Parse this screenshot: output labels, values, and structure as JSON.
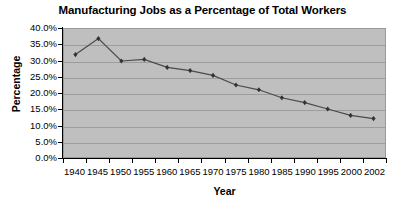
{
  "chart_data": {
    "type": "line",
    "title": "Manufacturing Jobs as a Percentage of Total Workers",
    "xlabel": "Year",
    "ylabel": "Percentage",
    "categories": [
      "1940",
      "1945",
      "1950",
      "1955",
      "1960",
      "1965",
      "1970",
      "1975",
      "1980",
      "1985",
      "1990",
      "1995",
      "2000",
      "2002"
    ],
    "values": [
      32.0,
      37.0,
      30.0,
      30.5,
      28.0,
      27.0,
      25.5,
      22.5,
      21.0,
      18.5,
      17.0,
      15.0,
      13.0,
      12.0
    ],
    "series": [
      {
        "name": "Manufacturing Jobs",
        "values": [
          32.0,
          37.0,
          30.0,
          30.5,
          28.0,
          27.0,
          25.5,
          22.5,
          21.0,
          18.5,
          17.0,
          15.0,
          13.0,
          12.0
        ]
      }
    ],
    "ylim": [
      0,
      40
    ],
    "ytick_labels": [
      "40.0%",
      "35.0%",
      "30.0%",
      "25.0%",
      "20.0%",
      "15.0%",
      "10.0%",
      "5.0%",
      "0.0%"
    ],
    "ytick_values": [
      40,
      35,
      30,
      25,
      20,
      15,
      10,
      5,
      0
    ],
    "grid": true,
    "legend": "none",
    "colors": {
      "plot_background": "#bfbfbf",
      "gridline": "#9d9d9d",
      "series_line": "#4a4a4a",
      "marker": "#333333",
      "axis": "#000000",
      "figure_background": "#ffffff"
    }
  }
}
